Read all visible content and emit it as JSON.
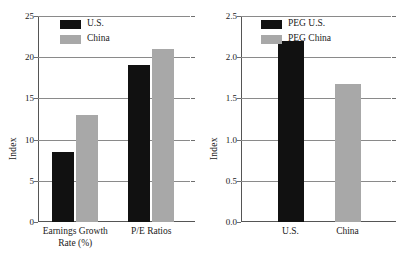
{
  "chart_data": [
    {
      "type": "bar",
      "title": "",
      "xlabel": "",
      "ylabel": "Index",
      "ylim": [
        0,
        25
      ],
      "yticks": [
        "0",
        "5",
        "10",
        "15",
        "20",
        "25"
      ],
      "ytick_values": [
        0,
        5,
        10,
        15,
        20,
        25
      ],
      "grid": true,
      "legend_position": "upper-left",
      "categories": [
        "Earnings Growth\nRate (%)",
        "P/E Ratios"
      ],
      "category_labels": [
        {
          "line1": "Earnings Growth",
          "line2": "Rate (%)"
        },
        {
          "line1": "P/E Ratios",
          "line2": ""
        }
      ],
      "series": [
        {
          "name": "U.S.",
          "color": "#111111",
          "values": [
            8.5,
            19
          ]
        },
        {
          "name": "China",
          "color": "#a8a8a8",
          "values": [
            13,
            21
          ]
        }
      ]
    },
    {
      "type": "bar",
      "title": "",
      "xlabel": "",
      "ylabel": "Index",
      "ylim": [
        0,
        2.5
      ],
      "yticks": [
        "0.0",
        "0.5",
        "1.0",
        "1.5",
        "2.0",
        "2.5"
      ],
      "ytick_values": [
        0,
        0.5,
        1.0,
        1.5,
        2.0,
        2.5
      ],
      "grid": true,
      "legend_position": "upper-right",
      "categories": [
        "U.S.",
        "China"
      ],
      "category_labels": [
        {
          "line1": "U.S.",
          "line2": ""
        },
        {
          "line1": "China",
          "line2": ""
        }
      ],
      "series": [
        {
          "name": "PEG U.S.",
          "color": "#111111",
          "values": [
            2.2,
            null
          ]
        },
        {
          "name": "PEG China",
          "color": "#a8a8a8",
          "values": [
            null,
            1.68
          ]
        }
      ]
    }
  ],
  "colors": {
    "bar_black": "#111111",
    "bar_gray": "#a8a8a8",
    "gridline": "#8a8a8a",
    "axis": "#555555",
    "background": "#ffffff",
    "text": "#1a1a1a"
  }
}
